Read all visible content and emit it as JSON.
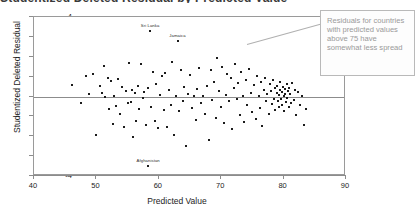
{
  "chart": {
    "clipped_title": "Studentized Deleted Residual by Predicted Value",
    "xlabel": "Predicted Value",
    "ylabel": "Studentized Deleted Residual"
  },
  "annotation": {
    "text": "Residuals for countries with predicted values above 75 have somewhat less spread"
  },
  "chart_data": {
    "type": "scatter",
    "title": "",
    "xlabel": "Predicted Value",
    "ylabel": "Studentized Deleted Residual",
    "xlim": [
      40,
      90
    ],
    "ylim": [
      -4,
      4
    ],
    "xticks": [
      40,
      50,
      60,
      70,
      80,
      90
    ],
    "yticks": [
      -4,
      -3,
      -2,
      -1,
      0,
      1,
      2,
      3,
      4
    ],
    "grid": false,
    "legend": null,
    "reference_line": {
      "axis": "y",
      "value": 0
    },
    "point_labels": [
      {
        "label": "Sri Lanka",
        "x": 58.6,
        "y": 3.28
      },
      {
        "label": "Jamaica",
        "x": 63.0,
        "y": 2.78
      },
      {
        "label": "Afghanistan",
        "x": 58.3,
        "y": -3.48
      }
    ],
    "points": [
      [
        46.1,
        0.6
      ],
      [
        47.5,
        -0.35
      ],
      [
        48.4,
        1.05
      ],
      [
        48.8,
        0.12
      ],
      [
        49.4,
        1.12
      ],
      [
        49.9,
        -1.92
      ],
      [
        50.6,
        0.55
      ],
      [
        50.9,
        0.18
      ],
      [
        51.2,
        1.55
      ],
      [
        51.4,
        -0.05
      ],
      [
        51.8,
        0.95
      ],
      [
        52.0,
        -0.62
      ],
      [
        52.4,
        0.8
      ],
      [
        52.6,
        -1.38
      ],
      [
        52.9,
        0.05
      ],
      [
        53.1,
        -0.48
      ],
      [
        53.5,
        0.9
      ],
      [
        53.8,
        -0.9
      ],
      [
        54.1,
        0.48
      ],
      [
        54.4,
        -1.55
      ],
      [
        54.7,
        0.3
      ],
      [
        55.0,
        -0.35
      ],
      [
        55.2,
        1.7
      ],
      [
        55.5,
        -0.28
      ],
      [
        55.7,
        0.35
      ],
      [
        55.9,
        -2.05
      ],
      [
        56.2,
        0.2
      ],
      [
        56.4,
        -1.22
      ],
      [
        56.7,
        0.52
      ],
      [
        56.9,
        -0.62
      ],
      [
        57.2,
        1.62
      ],
      [
        57.4,
        -0.08
      ],
      [
        57.7,
        0.25
      ],
      [
        57.9,
        -1.45
      ],
      [
        58.2,
        0.42
      ],
      [
        58.6,
        3.28
      ],
      [
        58.8,
        -0.55
      ],
      [
        59.1,
        1.25
      ],
      [
        59.4,
        -1.25
      ],
      [
        59.6,
        0.62
      ],
      [
        59.9,
        -1.58
      ],
      [
        60.2,
        0.08
      ],
      [
        60.5,
        1.05
      ],
      [
        60.8,
        -0.7
      ],
      [
        61.0,
        1.18
      ],
      [
        61.3,
        -1.55
      ],
      [
        61.6,
        0.32
      ],
      [
        61.9,
        -0.45
      ],
      [
        62.1,
        1.72
      ],
      [
        62.4,
        -1.95
      ],
      [
        62.7,
        0.05
      ],
      [
        63.0,
        2.78
      ],
      [
        63.2,
        -0.72
      ],
      [
        63.5,
        1.35
      ],
      [
        63.8,
        -0.25
      ],
      [
        64.1,
        0.48
      ],
      [
        64.4,
        -2.48
      ],
      [
        64.7,
        0.12
      ],
      [
        65.0,
        1.08
      ],
      [
        65.3,
        -0.58
      ],
      [
        65.6,
        0.02
      ],
      [
        65.9,
        -1.18
      ],
      [
        66.2,
        0.38
      ],
      [
        66.5,
        1.45
      ],
      [
        66.8,
        -0.32
      ],
      [
        67.1,
        0.02
      ],
      [
        67.4,
        -0.88
      ],
      [
        67.7,
        0.55
      ],
      [
        68.0,
        -2.18
      ],
      [
        68.3,
        1.32
      ],
      [
        68.6,
        -0.18
      ],
      [
        68.9,
        0.72
      ],
      [
        69.1,
        -1.08
      ],
      [
        69.4,
        1.92
      ],
      [
        69.7,
        0.28
      ],
      [
        70.0,
        -0.52
      ],
      [
        70.2,
        1.48
      ],
      [
        70.5,
        -1.35
      ],
      [
        70.8,
        0.08
      ],
      [
        71.0,
        1.15
      ],
      [
        71.3,
        -0.22
      ],
      [
        71.5,
        0.92
      ],
      [
        71.8,
        -1.62
      ],
      [
        72.0,
        0.45
      ],
      [
        72.2,
        1.62
      ],
      [
        72.5,
        -0.12
      ],
      [
        72.7,
        0.68
      ],
      [
        73.0,
        -0.92
      ],
      [
        73.2,
        1.22
      ],
      [
        73.5,
        0.05
      ],
      [
        73.7,
        -1.28
      ],
      [
        74.0,
        0.82
      ],
      [
        74.2,
        -0.42
      ],
      [
        74.5,
        1.38
      ],
      [
        74.7,
        0.18
      ],
      [
        75.0,
        -0.78
      ],
      [
        75.2,
        0.58
      ],
      [
        75.5,
        -1.12
      ],
      [
        75.7,
        1.02
      ],
      [
        76.0,
        0.02
      ],
      [
        76.2,
        -0.58
      ],
      [
        76.4,
        0.72
      ],
      [
        76.6,
        -1.48
      ],
      [
        76.8,
        0.35
      ],
      [
        77.0,
        0.95
      ],
      [
        77.2,
        -0.22
      ],
      [
        77.4,
        0.15
      ],
      [
        77.6,
        -0.88
      ],
      [
        77.8,
        0.62
      ],
      [
        78.0,
        0.28
      ],
      [
        78.1,
        -0.38
      ],
      [
        78.3,
        0.85
      ],
      [
        78.4,
        -0.12
      ],
      [
        78.6,
        0.42
      ],
      [
        78.7,
        -0.68
      ],
      [
        78.9,
        0.18
      ],
      [
        79.0,
        0.55
      ],
      [
        79.1,
        -0.25
      ],
      [
        79.2,
        0.08
      ],
      [
        79.3,
        -0.52
      ],
      [
        79.4,
        0.32
      ],
      [
        79.5,
        0.72
      ],
      [
        79.6,
        -0.15
      ],
      [
        79.7,
        0.22
      ],
      [
        79.8,
        -0.42
      ],
      [
        79.9,
        0.48
      ],
      [
        80.0,
        0.02
      ],
      [
        80.1,
        -0.72
      ],
      [
        80.2,
        0.38
      ],
      [
        80.3,
        0.15
      ],
      [
        80.4,
        -0.28
      ],
      [
        80.5,
        0.62
      ],
      [
        80.6,
        -0.08
      ],
      [
        80.7,
        0.28
      ],
      [
        80.8,
        -0.55
      ],
      [
        80.9,
        0.45
      ],
      [
        81.0,
        0.12
      ],
      [
        81.2,
        -0.35
      ],
      [
        81.4,
        0.68
      ],
      [
        81.6,
        -0.18
      ],
      [
        81.8,
        0.32
      ],
      [
        82.0,
        -0.95
      ],
      [
        82.3,
        0.22
      ],
      [
        82.6,
        -0.45
      ],
      [
        82.9,
        0.05
      ],
      [
        83.2,
        -1.42
      ],
      [
        83.6,
        -0.62
      ]
    ]
  }
}
